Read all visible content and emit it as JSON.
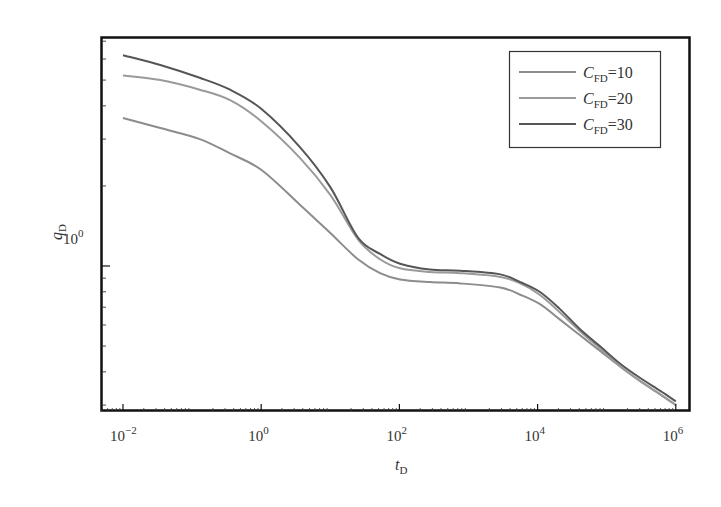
{
  "chart_data": {
    "type": "line",
    "title": "",
    "xlabel": "t_D",
    "ylabel": "q_D",
    "xscale": "log",
    "yscale": "log",
    "xlim_log10": [
      -2.33,
      6.2
    ],
    "ylim": [
      0.285,
      7.3
    ],
    "x_ticks": [
      {
        "exp": -2,
        "label": "10",
        "sup": "−2"
      },
      {
        "exp": 0,
        "label": "10",
        "sup": "0"
      },
      {
        "exp": 2,
        "label": "10",
        "sup": "2"
      },
      {
        "exp": 4,
        "label": "10",
        "sup": "4"
      },
      {
        "exp": 6,
        "label": "10",
        "sup": "6"
      }
    ],
    "y_ticks": [
      {
        "value": 1,
        "label": "10",
        "sup": "0"
      }
    ],
    "grid": false,
    "legend_position": "upper right",
    "x_log10": [
      -2,
      -1.46,
      -0.89,
      -0.45,
      0,
      0.56,
      1.0,
      1.4,
      1.72,
      2.01,
      2.44,
      2.88,
      3.46,
      3.75,
      4.03,
      4.32,
      4.61,
      4.9,
      5.19,
      5.48,
      5.77,
      6.0
    ],
    "series": [
      {
        "name": "C_FD=10",
        "sub": "FD",
        "value": "=10",
        "color": "#8c8c8c",
        "values": [
          3.6,
          3.3,
          3.0,
          2.65,
          2.3,
          1.7,
          1.33,
          1.06,
          0.94,
          0.89,
          0.87,
          0.86,
          0.83,
          0.78,
          0.72,
          0.63,
          0.55,
          0.48,
          0.42,
          0.37,
          0.33,
          0.3
        ]
      },
      {
        "name": "C_FD=20",
        "sub": "FD",
        "value": "=20",
        "color": "#9a9a9a",
        "values": [
          5.2,
          5.0,
          4.6,
          4.2,
          3.5,
          2.55,
          1.85,
          1.26,
          1.06,
          0.98,
          0.95,
          0.94,
          0.91,
          0.86,
          0.78,
          0.67,
          0.57,
          0.49,
          0.42,
          0.37,
          0.33,
          0.3
        ]
      },
      {
        "name": "C_FD=30",
        "sub": "FD",
        "value": "=30",
        "color": "#555555",
        "values": [
          6.2,
          5.7,
          5.1,
          4.6,
          3.9,
          2.8,
          1.98,
          1.28,
          1.11,
          1.02,
          0.97,
          0.96,
          0.93,
          0.87,
          0.8,
          0.69,
          0.58,
          0.5,
          0.43,
          0.38,
          0.34,
          0.31
        ]
      }
    ]
  }
}
